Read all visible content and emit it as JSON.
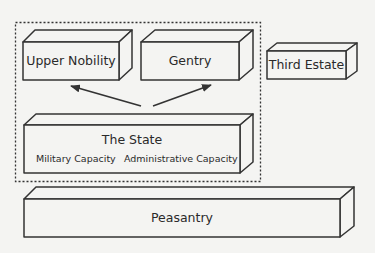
{
  "diagram": {
    "type": "block-diagram",
    "group": {
      "style": "dashed",
      "members": [
        "upper_nobility",
        "gentry",
        "state"
      ]
    },
    "boxes": {
      "upper_nobility": {
        "label": "Upper Nobility"
      },
      "gentry": {
        "label": "Gentry"
      },
      "third_estate": {
        "label": "Third Estate"
      },
      "state": {
        "label": "The State",
        "sublabels": [
          "Military Capacity",
          "Administrative Capacity"
        ]
      },
      "peasantry": {
        "label": "Peasantry"
      }
    },
    "arrows": [
      {
        "from": "state",
        "to": "upper_nobility"
      },
      {
        "from": "state",
        "to": "gentry"
      }
    ],
    "colors": {
      "stroke": "#333333",
      "fill": "#f4f4f2",
      "text": "#2a2a2a"
    }
  }
}
